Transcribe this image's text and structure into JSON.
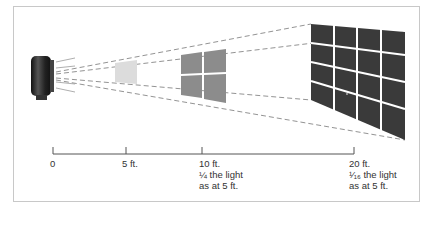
{
  "diagram": {
    "source": {
      "icon": "flash-unit-icon"
    },
    "panels": [
      {
        "distance": "5 ft.",
        "grid": "1x1",
        "color": "#dcdcdc"
      },
      {
        "distance": "10 ft.",
        "grid": "2x2",
        "color": "#8c8c8c"
      },
      {
        "distance": "20 ft.",
        "grid": "4x4",
        "color": "#3a3a3a"
      }
    ],
    "axis": {
      "ticks": [
        {
          "label": "0"
        },
        {
          "label": "5 ft."
        },
        {
          "label": "10 ft.",
          "note_line1": "¼ the light",
          "note_line2": "as at 5 ft."
        },
        {
          "label": "20 ft.",
          "note_line1": "¹⁄₁₆ the light",
          "note_line2": "as at 5 ft."
        }
      ]
    },
    "colors": {
      "frame": "#c8c8c8",
      "axis": "#555555",
      "dash": "#666666"
    }
  }
}
